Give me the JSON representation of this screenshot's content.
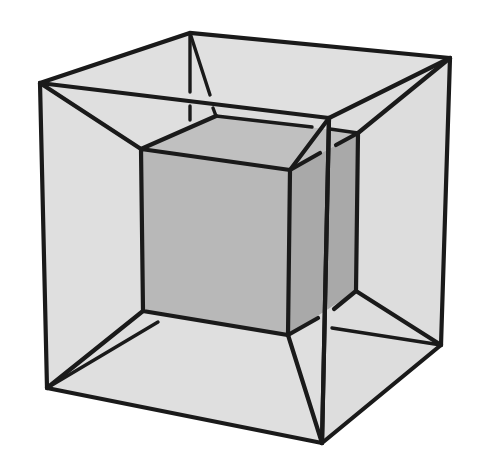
{
  "figure": {
    "colors": {
      "background": "#ffffff",
      "outer_face": "#dedede",
      "inner_face_front": "#b9b9b9",
      "inner_face_side": "#a9a9a9",
      "inner_face_top": "#c2c2c2",
      "edge": "#1a1a1a"
    },
    "outer_cube": {
      "front": {
        "tl": [
          40,
          83
        ],
        "tr": [
          329,
          118
        ],
        "br": [
          322,
          443
        ],
        "bl": [
          47,
          388
        ]
      },
      "back": {
        "tl": [
          190,
          33
        ],
        "tr": [
          450,
          58
        ],
        "br": [
          441,
          345
        ],
        "bl": [
          196,
          300
        ]
      }
    },
    "inner_cube": {
      "front": {
        "tl": [
          141,
          149
        ],
        "tr": [
          290,
          170
        ],
        "br": [
          288,
          335
        ],
        "bl": [
          143,
          311
        ]
      },
      "back": {
        "tl": [
          216,
          116
        ],
        "tr": [
          358,
          133
        ],
        "br": [
          356,
          291
        ],
        "bl": [
          218,
          275
        ]
      }
    }
  }
}
